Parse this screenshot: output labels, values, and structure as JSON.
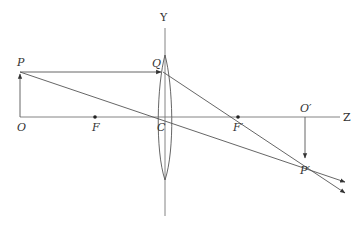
{
  "diagram": {
    "type": "ray-diagram-convex-lens",
    "colors": {
      "line": "#555555",
      "axis": "#777777",
      "text": "#333333",
      "background": "#ffffff"
    },
    "labels": {
      "y_axis": "Y",
      "z_axis": "Z",
      "object_top": "P",
      "object_base": "O",
      "lens_point": "Q",
      "focus_front": "F",
      "lens_center": "C",
      "focus_back": "F′",
      "image_base": "O′",
      "image_top": "P′"
    },
    "points": {
      "O": [
        20,
        117
      ],
      "P": [
        20,
        72
      ],
      "F": [
        95,
        117
      ],
      "C": [
        165,
        117
      ],
      "Q": [
        163,
        72
      ],
      "F_prime": [
        238,
        117
      ],
      "O_prime": [
        305,
        117
      ],
      "P_prime": [
        305,
        160
      ]
    }
  }
}
